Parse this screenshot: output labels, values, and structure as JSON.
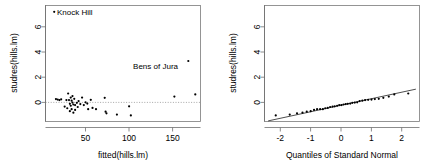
{
  "figure": {
    "background": "#ffffff",
    "point_color": "#000000",
    "axis_color": "#6e6e6e",
    "refline_color": "#909090"
  },
  "chart_data": [
    {
      "type": "scatter",
      "panel": "left",
      "title": "",
      "xlabel": "fitted(hills.lm)",
      "ylabel": "studres(hills.lm)",
      "xlim": [
        4,
        182
      ],
      "ylim": [
        -1.6,
        7.6
      ],
      "xticks": [
        50,
        100,
        150
      ],
      "xtick_labels": [
        "50",
        "100",
        "150"
      ],
      "yticks": [
        0,
        2,
        4,
        6
      ],
      "ytick_labels": [
        "0",
        "2",
        "4",
        "6"
      ],
      "grid": false,
      "legend": "none",
      "reference_lines": [
        {
          "orientation": "horizontal",
          "value": 0,
          "style": "dotted"
        }
      ],
      "annotations": [
        {
          "text": "Knock Hill",
          "x": 14,
          "y": 7.1,
          "anchor": "left"
        },
        {
          "text": "Bens of Jura",
          "x": 168,
          "y": 3.2,
          "anchor": "right"
        }
      ],
      "x": [
        14,
        16,
        18,
        20,
        22,
        26,
        28,
        29,
        30,
        31,
        32,
        32,
        33,
        33,
        34,
        34,
        35,
        35,
        36,
        36,
        37,
        38,
        38,
        40,
        41,
        42,
        44,
        46,
        48,
        50,
        52,
        53,
        56,
        58,
        62,
        72,
        73,
        74,
        86,
        100,
        102,
        152,
        168,
        176
      ],
      "y": [
        7.1,
        0.18,
        0.14,
        0.1,
        0.16,
        -0.42,
        0.1,
        -0.55,
        0.62,
        0.1,
        -0.2,
        -0.78,
        0.3,
        -0.35,
        0.05,
        -0.62,
        0.42,
        -0.1,
        -0.25,
        -0.9,
        0.2,
        -0.3,
        -0.68,
        -0.12,
        -0.45,
        0.02,
        -0.22,
        0.3,
        -0.3,
        -0.08,
        -0.18,
        -0.62,
        0.12,
        -0.52,
        -0.62,
        0.28,
        -0.82,
        -0.95,
        -1.05,
        -0.4,
        -1.12,
        0.38,
        3.2,
        0.55
      ]
    },
    {
      "type": "scatter",
      "panel": "right",
      "title": "",
      "xlabel": "Quantiles of Standard Normal",
      "ylabel": "studres(hills.lm)",
      "xlim": [
        -2.55,
        2.55
      ],
      "ylim": [
        -1.6,
        7.6
      ],
      "xticks": [
        -2,
        -1,
        0,
        1,
        2
      ],
      "xtick_labels": [
        "-2",
        "-1",
        "0",
        "1",
        "2"
      ],
      "yticks": [
        0,
        2,
        4,
        6
      ],
      "ytick_labels": [
        "0",
        "2",
        "4",
        "6"
      ],
      "grid": false,
      "legend": "none",
      "reference_lines": [
        {
          "orientation": "qq-fit",
          "style": "solid"
        }
      ],
      "annotations": [],
      "x": [
        -2.18,
        -1.72,
        -1.48,
        -1.3,
        -1.16,
        -1.03,
        -0.92,
        -0.82,
        -0.72,
        -0.63,
        -0.55,
        -0.47,
        -0.39,
        -0.31,
        -0.24,
        -0.16,
        -0.09,
        -0.02,
        0.05,
        0.12,
        0.19,
        0.27,
        0.34,
        0.42,
        0.5,
        0.58,
        0.67,
        0.76,
        0.86,
        0.97,
        1.08,
        1.21,
        1.36,
        1.54,
        1.72,
        2.18
      ],
      "y": [
        -1.12,
        -1.05,
        -0.95,
        -0.9,
        -0.82,
        -0.78,
        -0.68,
        -0.62,
        -0.62,
        -0.62,
        -0.55,
        -0.52,
        -0.45,
        -0.42,
        -0.4,
        -0.35,
        -0.3,
        -0.3,
        -0.25,
        -0.22,
        -0.2,
        -0.18,
        -0.12,
        -0.1,
        -0.08,
        0.02,
        0.05,
        0.1,
        0.12,
        0.14,
        0.18,
        0.2,
        0.28,
        0.38,
        0.55,
        0.62,
        3.2,
        7.1
      ]
    }
  ],
  "panels": {
    "left": {
      "xlabel": "fitted(hills.lm)",
      "ylabel": "studres(hills.lm)",
      "xtick_labels": [
        "50",
        "100",
        "150"
      ],
      "ytick_labels": [
        "0",
        "2",
        "4",
        "6"
      ],
      "label_knock_hill": "Knock Hill",
      "label_bens_of_jura": "Bens of Jura"
    },
    "right": {
      "xlabel": "Quantiles of Standard Normal",
      "ylabel": "studres(hills.lm)",
      "xtick_labels": [
        "-2",
        "-1",
        "0",
        "1",
        "2"
      ],
      "ytick_labels": [
        "0",
        "2",
        "4",
        "6"
      ]
    }
  }
}
